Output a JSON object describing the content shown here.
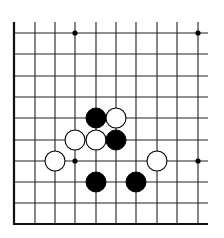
{
  "board": {
    "description": "Go board diagram fragment (left and bottom edges visible)",
    "columns": 10,
    "rows": 10,
    "col_x": [
      14,
      35,
      55,
      75,
      96,
      116,
      136,
      157,
      177,
      198
    ],
    "row_y": [
      33,
      54,
      76,
      97,
      118,
      140,
      161,
      182,
      203,
      224
    ],
    "line_color": "#222222",
    "edge_color": "#111111",
    "stone_radius": 10,
    "star_points": [
      {
        "col": 3,
        "row": 0
      },
      {
        "col": 9,
        "row": 0
      },
      {
        "col": 3,
        "row": 6
      },
      {
        "col": 9,
        "row": 6
      }
    ],
    "stones": [
      {
        "color": "black",
        "col": 4,
        "row": 4
      },
      {
        "color": "white",
        "col": 5,
        "row": 4
      },
      {
        "color": "white",
        "col": 3,
        "row": 5
      },
      {
        "color": "white",
        "col": 4,
        "row": 5
      },
      {
        "color": "black",
        "col": 5,
        "row": 5
      },
      {
        "color": "white",
        "col": 2,
        "row": 6
      },
      {
        "color": "white",
        "col": 7,
        "row": 6
      },
      {
        "color": "black",
        "col": 4,
        "row": 7
      },
      {
        "color": "black",
        "col": 6,
        "row": 7
      }
    ]
  }
}
